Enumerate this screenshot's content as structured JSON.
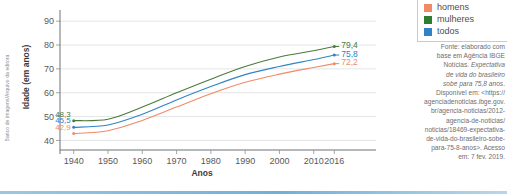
{
  "credit": {
    "text": "Banco de imagens/Arquivo da editora"
  },
  "axes": {
    "y_title": "Idade (em anos)",
    "x_title": "Anos"
  },
  "legend": {
    "items": [
      {
        "label": "homens",
        "color": "#f08a66",
        "swatch_name": "legend-swatch-homens"
      },
      {
        "label": "mulheres",
        "color": "#2e7d32",
        "swatch_name": "legend-swatch-mulheres"
      },
      {
        "label": "todos",
        "color": "#2f84c8",
        "swatch_name": "legend-swatch-todos"
      }
    ]
  },
  "source": {
    "line1": "Fonte: elaborado com",
    "line2": "base em Agência IBGE",
    "line3": "Notícias. ",
    "line3_italic": "Expectativa",
    "line4_italic": "de vida do brasileiro",
    "line5_italic": "sobe para 75,8 anos",
    "line5_tail": ".",
    "line6": "Disponível em: <https://",
    "line7": "agenciadenoticias.ibge.gov.",
    "line8": "br/agencia-noticias/2012-",
    "line9": "agencia-de-noticias/",
    "line10": "noticias/18469-expectativa-",
    "line11": "de-vida-do-brasileiro-sobe-",
    "line12": "para-75-8-anos>. Acesso",
    "line13": "em: 7 fev. 2019."
  },
  "chart_data": {
    "type": "line",
    "title": "",
    "xlabel": "Anos",
    "ylabel": "Idade (em anos)",
    "xlim": [
      1936,
      2020
    ],
    "ylim": [
      36,
      93
    ],
    "yticks": [
      40,
      50,
      60,
      70,
      80,
      90
    ],
    "xticks": [
      1940,
      1950,
      1960,
      1970,
      1980,
      1990,
      2000,
      2010,
      2016
    ],
    "grid": "horizontal",
    "legend_position": "top-right",
    "x": [
      1940,
      1950,
      1960,
      1970,
      1980,
      1990,
      2000,
      2010,
      2016
    ],
    "series": [
      {
        "name": "mulheres",
        "color": "#4a7a3a",
        "values": [
          48.3,
          48.9,
          54.0,
          60.0,
          65.7,
          71.0,
          75.0,
          77.6,
          79.4
        ],
        "start_label": "48,3",
        "end_label": "79,4"
      },
      {
        "name": "todos",
        "color": "#2f84c8",
        "values": [
          45.5,
          46.5,
          51.0,
          57.0,
          62.6,
          67.6,
          71.0,
          73.9,
          75.8
        ],
        "start_label": "45,5",
        "end_label": "75,8"
      },
      {
        "name": "homens",
        "color": "#f08a66",
        "values": [
          42.9,
          44.1,
          48.4,
          54.0,
          59.6,
          64.4,
          67.8,
          70.6,
          72.2
        ],
        "start_label": "42,9",
        "end_label": "72,2"
      }
    ],
    "axis_tick_labels_y": [
      "40",
      "50",
      "60",
      "70",
      "80",
      "90"
    ],
    "axis_tick_labels_x": [
      "1940",
      "1950",
      "1960",
      "1970",
      "1980",
      "1990",
      "2000",
      "2010",
      "2016"
    ]
  }
}
